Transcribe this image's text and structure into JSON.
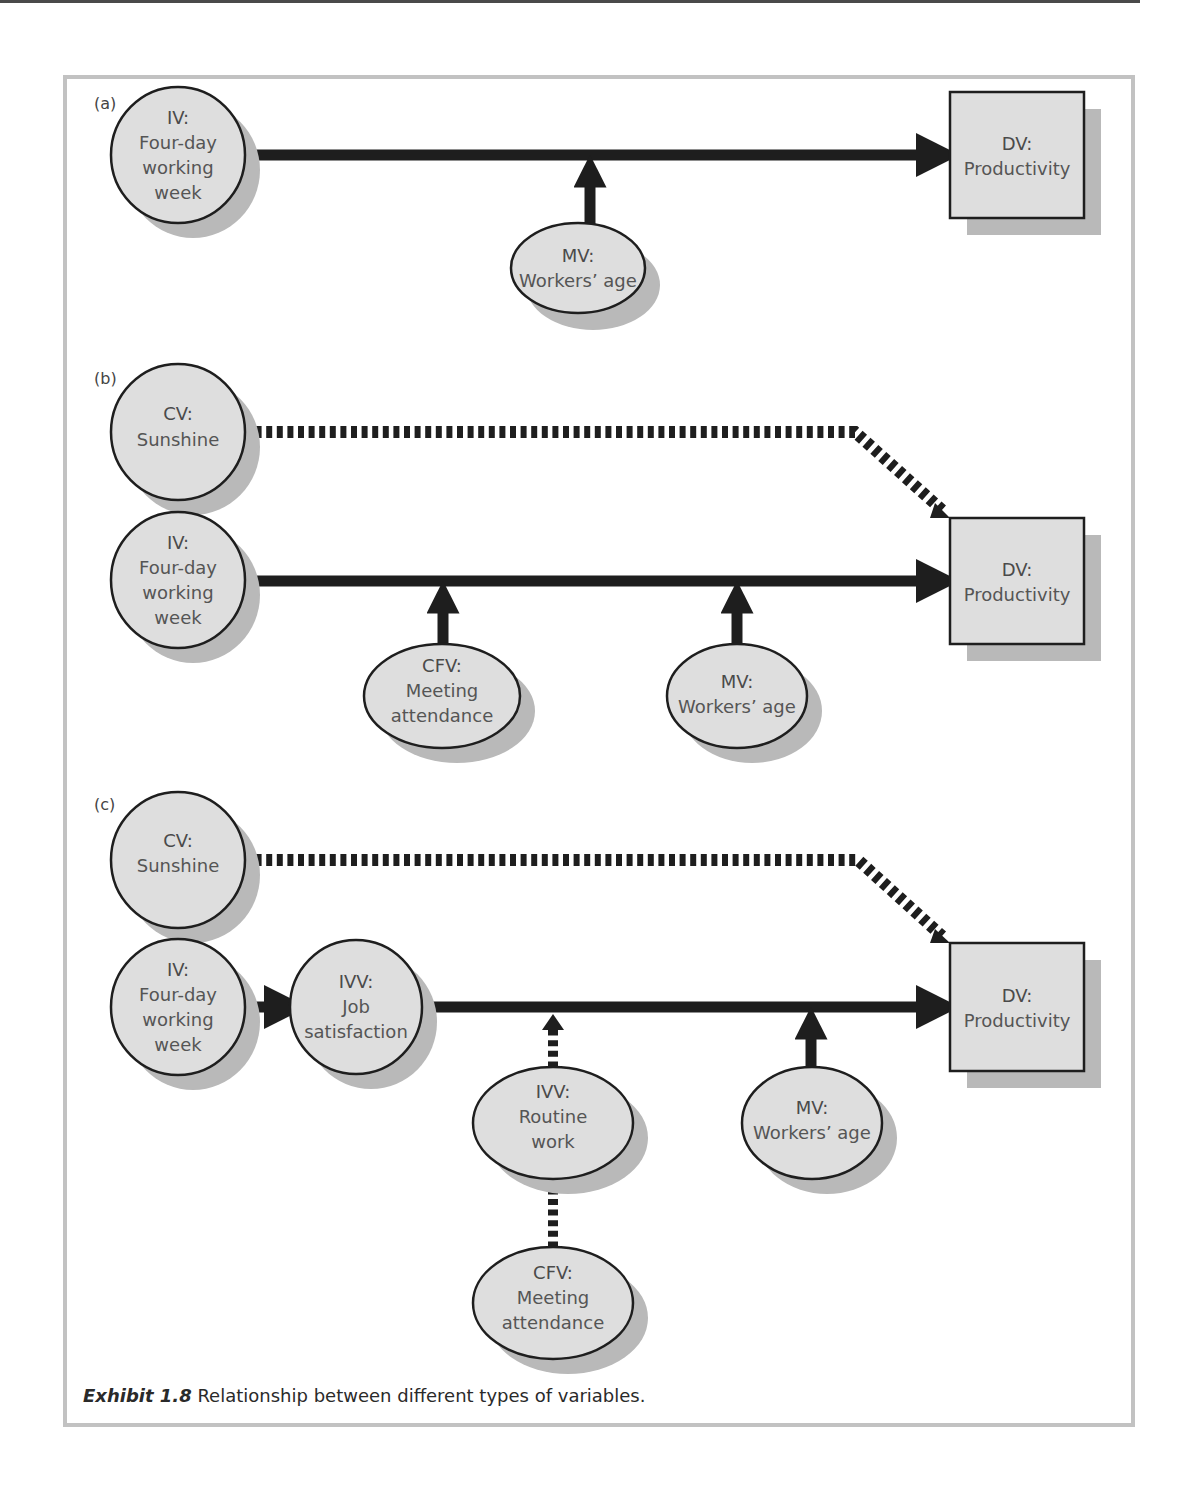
{
  "caption": {
    "label": "Exhibit 1.8",
    "text": " Relationship between different types of variables."
  },
  "colors": {
    "node_fill": "#dedede",
    "node_stroke": "#1e1e1e",
    "shadow": "#b9b9b9",
    "arrow": "#1e1e1e",
    "frame": "#c2c2c2"
  },
  "panels": {
    "a": {
      "label": "(a)",
      "iv": {
        "head": "IV:",
        "lines": [
          "Four-day",
          "working",
          "week"
        ]
      },
      "dv": {
        "head": "DV:",
        "lines": [
          "Productivity"
        ]
      },
      "mv": {
        "head": "MV:",
        "lines": [
          "Workers’ age"
        ]
      }
    },
    "b": {
      "label": "(b)",
      "cv": {
        "head": "CV:",
        "lines": [
          "Sunshine"
        ]
      },
      "iv": {
        "head": "IV:",
        "lines": [
          "Four-day",
          "working",
          "week"
        ]
      },
      "dv": {
        "head": "DV:",
        "lines": [
          "Productivity"
        ]
      },
      "cfv": {
        "head": "CFV:",
        "lines": [
          "Meeting",
          "attendance"
        ]
      },
      "mv": {
        "head": "MV:",
        "lines": [
          "Workers’ age"
        ]
      }
    },
    "c": {
      "label": "(c)",
      "cv": {
        "head": "CV:",
        "lines": [
          "Sunshine"
        ]
      },
      "iv": {
        "head": "IV:",
        "lines": [
          "Four-day",
          "working",
          "week"
        ]
      },
      "ivv_job": {
        "head": "IVV:",
        "lines": [
          "Job",
          "satisfaction"
        ]
      },
      "dv": {
        "head": "DV:",
        "lines": [
          "Productivity"
        ]
      },
      "ivv_routine": {
        "head": "IVV:",
        "lines": [
          "Routine",
          "work"
        ]
      },
      "mv": {
        "head": "MV:",
        "lines": [
          "Workers’ age"
        ]
      },
      "cfv": {
        "head": "CFV:",
        "lines": [
          "Meeting",
          "attendance"
        ]
      }
    }
  },
  "legend_of_abbreviations_visible": [
    "IV",
    "DV",
    "MV",
    "CV",
    "CFV",
    "IVV"
  ]
}
